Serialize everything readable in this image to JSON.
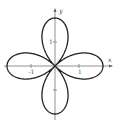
{
  "chart_data": {
    "type": "line",
    "subtype": "polar-rose",
    "title": "",
    "equation": "r = 2cos(2θ)",
    "petals": 4,
    "amplitude": 2,
    "xlabel": "x",
    "ylabel": "y",
    "x_ticks": [
      {
        "value": -1,
        "label": "-1"
      },
      {
        "value": 1,
        "label": "1"
      }
    ],
    "y_ticks": [
      {
        "value": 1,
        "label": "1"
      },
      {
        "value": -1,
        "label": ""
      }
    ],
    "xlim": [
      -2,
      2.3
    ],
    "ylim": [
      -2.1,
      2.3
    ],
    "grid": false,
    "legend": null,
    "petal_tips": [
      [
        2,
        0
      ],
      [
        0,
        2
      ],
      [
        -2,
        0
      ],
      [
        0,
        -2
      ]
    ]
  },
  "colors": {
    "curve": "#222222",
    "axes": "#777777",
    "background": "#ffffff"
  },
  "layout": {
    "origin_px": [
      55,
      66
    ],
    "unit_px": 24
  }
}
